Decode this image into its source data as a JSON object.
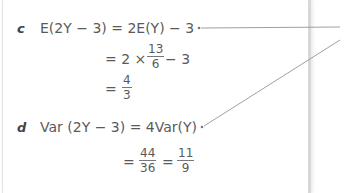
{
  "part_c": {
    "label": "c",
    "line1": "E(2Y − 3) = 2E(Y) − 3",
    "line2_prefix": "= 2 × ",
    "line2_frac": {
      "num": "13",
      "den": "6"
    },
    "line2_suffix": "− 3",
    "line3_prefix": "=",
    "line3_frac": {
      "num": "4",
      "den": "3"
    }
  },
  "part_d": {
    "label": "d",
    "line1": "Var (2Y − 3) = 4Var(Y)",
    "line2_prefix": "=",
    "line2_frac1": {
      "num": "44",
      "den": "36"
    },
    "line2_eq": "=",
    "line2_frac2": {
      "num": "11",
      "den": "9"
    }
  },
  "colors": {
    "text": "#5a5a5a",
    "line": "#888888"
  }
}
